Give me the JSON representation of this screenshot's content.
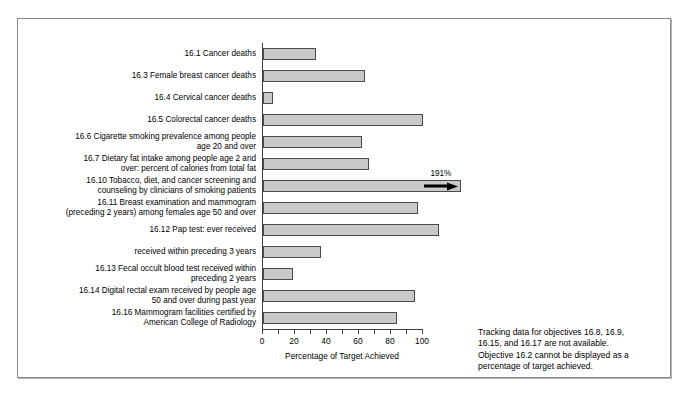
{
  "chart_data": {
    "type": "bar",
    "orientation": "horizontal",
    "title": "",
    "xlabel": "Percentage of Target Achieved",
    "ylabel": "",
    "xlim": [
      0,
      100
    ],
    "xticks": [
      0,
      10,
      20,
      30,
      40,
      50,
      60,
      70,
      80,
      90,
      100
    ],
    "xtick_labels": [
      "0",
      "",
      "20",
      "",
      "40",
      "",
      "60",
      "",
      "80",
      "",
      "100"
    ],
    "grid": false,
    "legend": false,
    "categories": [
      "16.1 Cancer deaths",
      "16.3 Female breast cancer deaths",
      "16.4 Cervical cancer deaths",
      "16.5 Colorectal cancer deaths",
      "16.6 Cigarette smoking prevalence among people\nage 20 and over",
      "16.7 Dietary fat intake among people age 2 and\nover: percent of calories from total fat",
      "16.10 Tobacco, diet, and cancer screening and\ncounseling by clinicians of smoking patients",
      "16.11 Breast examination and mammogram\n(preceding 2 years) among females age 50 and over",
      "16.12 Pap test: ever received",
      "received within preceding 3 years",
      "16.13 Fecal occult blood test received within\npreceding 2 years",
      "16.14 Digital rectal exam received by people age\n50 and over during past year",
      "16.16 Mammogram facilities certified by\nAmerican College of Radiology"
    ],
    "values": [
      33,
      64,
      6,
      100,
      62,
      66,
      191,
      97,
      110,
      36,
      19,
      95,
      84
    ],
    "annotations": [
      {
        "category": "16.10 Tobacco, diet, and cancer screening and counseling by clinicians of smoking patients",
        "label": "191%",
        "type": "overflow-arrow"
      }
    ]
  },
  "note": {
    "lines": [
      "Tracking data for objectives 16.8, 16.9,",
      "16.15, and 16.17 are not available.",
      "Objective 16.2 cannot be displayed as a",
      "percentage of target achieved."
    ]
  },
  "colors": {
    "bar_fill": "#c9c9c9",
    "bar_border": "#4a4a4a",
    "axis": "#404040",
    "frame": "#8a8a8a",
    "text": "#000000"
  }
}
